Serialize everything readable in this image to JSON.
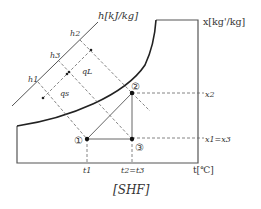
{
  "title": "[SHF]",
  "axes": {
    "enthalpy_label": "h[kJ/kg]",
    "humidity_label": "x[kg'/kg]",
    "temperature_label": "t[℃]"
  },
  "enthalpy_ticks": [
    "h2",
    "h3",
    "h1"
  ],
  "heat_labels": {
    "latent": "qL",
    "sensible": "qs"
  },
  "points": [
    {
      "id": "1",
      "label": "①"
    },
    {
      "id": "2",
      "label": "②"
    },
    {
      "id": "3",
      "label": "③"
    }
  ],
  "humidity_ticks": [
    "x2",
    "x1=x3"
  ],
  "temperature_ticks": [
    "t1",
    "t2=t3"
  ]
}
